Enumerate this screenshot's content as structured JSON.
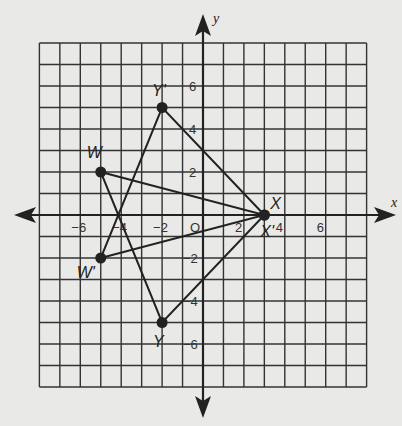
{
  "chart_data": {
    "type": "scatter",
    "title": "",
    "xlabel": "x",
    "ylabel": "y",
    "xlim": [
      -8,
      8
    ],
    "ylim": [
      -8,
      8
    ],
    "grid": true,
    "x_tick_labels": [
      {
        "value": -6,
        "label": "−6"
      },
      {
        "value": -4,
        "label": "−4"
      },
      {
        "value": -2,
        "label": "−2"
      },
      {
        "value": 0,
        "label": "O"
      },
      {
        "value": 2,
        "label": "2"
      },
      {
        "value": 4,
        "label": "4"
      },
      {
        "value": 6,
        "label": "6"
      }
    ],
    "y_tick_labels": [
      {
        "value": 6,
        "label": "6"
      },
      {
        "value": 4,
        "label": "4"
      },
      {
        "value": 2,
        "label": "2"
      },
      {
        "value": -2,
        "label": "−2"
      },
      {
        "value": -4,
        "label": "−4"
      },
      {
        "value": -6,
        "label": "−6"
      }
    ],
    "points": [
      {
        "name": "W",
        "x": -5,
        "y": 2
      },
      {
        "name": "X",
        "x": 3,
        "y": 0
      },
      {
        "name": "Y",
        "x": -2,
        "y": -5
      },
      {
        "name": "W'",
        "x": -5,
        "y": -2
      },
      {
        "name": "X'",
        "x": 3,
        "y": 0
      },
      {
        "name": "Y'",
        "x": -2,
        "y": 5
      }
    ],
    "series": [
      {
        "name": "Triangle WXY",
        "vertices": [
          "W",
          "X",
          "Y"
        ]
      },
      {
        "name": "Triangle W'X'Y'",
        "vertices": [
          "W'",
          "X'",
          "Y'"
        ]
      }
    ]
  },
  "colors": {
    "background": "#e9e9e7",
    "ink": "#222222",
    "grid": "#333333"
  }
}
